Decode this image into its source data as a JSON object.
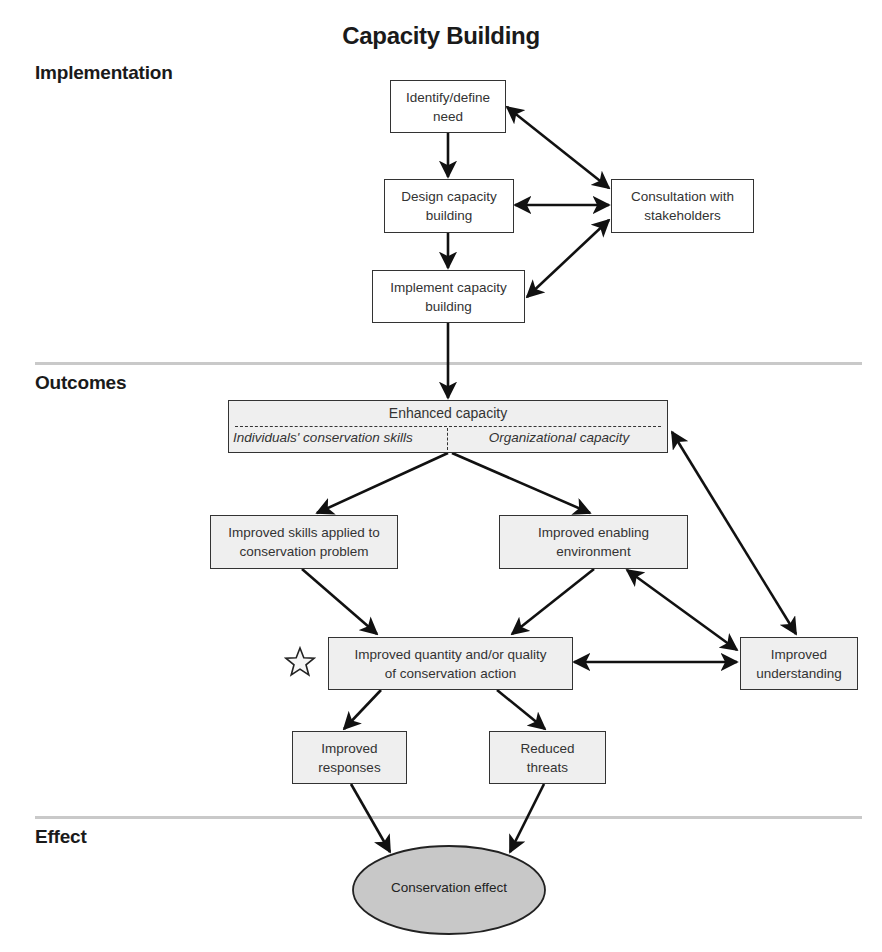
{
  "title": "Capacity Building",
  "sections": {
    "implementation": "Implementation",
    "outcomes": "Outcomes",
    "effect": "Effect"
  },
  "nodes": {
    "identify": {
      "line1": "Identify/define",
      "line2": "need"
    },
    "design": {
      "line1": "Design capacity",
      "line2": "building"
    },
    "consultation": {
      "line1": "Consultation with",
      "line2": "stakeholders"
    },
    "implement": {
      "line1": "Implement capacity",
      "line2": "building"
    },
    "enhanced": {
      "title": "Enhanced capacity",
      "left": "Individuals' conservation skills",
      "right": "Organizational capacity"
    },
    "skills": {
      "line1": "Improved skills applied to",
      "line2": "conservation problem"
    },
    "enabling": {
      "line1": "Improved enabling",
      "line2": "environment"
    },
    "quantity": {
      "line1": "Improved quantity and/or quality",
      "line2": "of conservation action"
    },
    "understanding": {
      "line1": "Improved",
      "line2": "understanding"
    },
    "responses": {
      "line1": "Improved",
      "line2": "responses"
    },
    "threats": {
      "line1": "Reduced",
      "line2": "threats"
    },
    "effect": {
      "label": "Conservation effect"
    }
  },
  "markers": {
    "star": "star-icon"
  },
  "colors": {
    "box_fill": "#efefef",
    "ellipse_fill": "#c8c8c8",
    "line": "#111111",
    "divider": "#c9c9c9"
  }
}
